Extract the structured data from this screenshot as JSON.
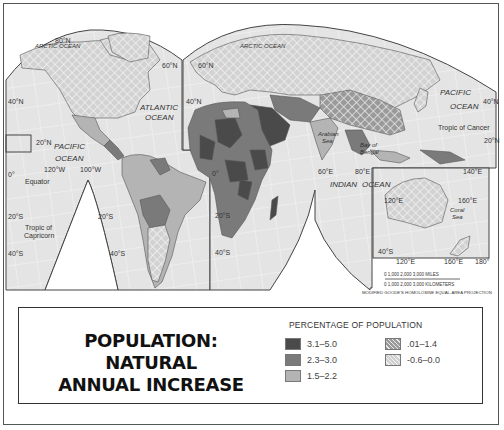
{
  "map": {
    "projection_note": "MODIFIED GOODE'S HOMOLOSINE EQUAL-AREA PROJECTION",
    "scale": {
      "miles_label": "0    1,000   2,000   3,000 MILES",
      "km_label": "0  1,000  2,000  3,000 KILOMETERS"
    },
    "ocean_labels": {
      "arctic_w": "ARCTIC OCEAN",
      "arctic_e": "ARCTIC OCEAN",
      "atlantic_1": "ATLANTIC",
      "atlantic_2": "OCEAN",
      "pacific_w_1": "PACIFIC",
      "pacific_w_2": "OCEAN",
      "pacific_e_1": "PACIFIC",
      "pacific_e_2": "OCEAN",
      "indian": "INDIAN",
      "indian_ocean": "OCEAN",
      "arabian_1": "Arabian",
      "arabian_2": "Sea",
      "bengal_1": "Bay of",
      "bengal_2": "Bengal",
      "coral_1": "Coral",
      "coral_2": "Sea"
    },
    "lines": {
      "equator": "Equator",
      "tropic_cancer": "Tropic of Cancer",
      "tropic_capricorn_1": "Tropic of",
      "tropic_capricorn_2": "Capricorn"
    },
    "grid_labels": {
      "n80": "80°N",
      "n60_w": "60°N",
      "n60_e": "60°N",
      "n40_w": "40°N",
      "n40_e": "40°N",
      "n40_pac": "40°N",
      "n20_w": "20°N",
      "n20_e": "20°N",
      "zero_w": "0°",
      "zero_e": "0°",
      "w120": "120°W",
      "w100": "100°W",
      "s20_w": "20°S",
      "s20_m": "20°S",
      "s20_e": "20°S",
      "s40_w": "40°S",
      "s40_m": "40°S",
      "s40_e": "40°S",
      "s40_au": "40°S",
      "e60": "60°E",
      "e80": "80°E",
      "e140": "140°E",
      "e120_top": "120°E",
      "e160_top": "160°E",
      "e120_bot": "120°E",
      "e160_bot": "160°E",
      "e180": "180°"
    }
  },
  "legend": {
    "title_line1": "POPULATION:   NATURAL",
    "title_line2": "ANNUAL INCREASE",
    "heading": "PERCENTAGE OF POPULATION",
    "items": [
      {
        "label": "3.1–5.0",
        "color": "#4a4a4a",
        "pattern": "solid"
      },
      {
        "label": "2.3–3.0",
        "color": "#7a7a7a",
        "pattern": "solid"
      },
      {
        "label": "1.5–2.2",
        "color": "#b4b4b4",
        "pattern": "solid"
      },
      {
        "label": ".01–1.4",
        "color": "#9a9a9a",
        "pattern": "crosshatch-dark"
      },
      {
        "label": "-0.6–0.0",
        "color": "#d0d0d0",
        "pattern": "crosshatch-light"
      }
    ]
  }
}
